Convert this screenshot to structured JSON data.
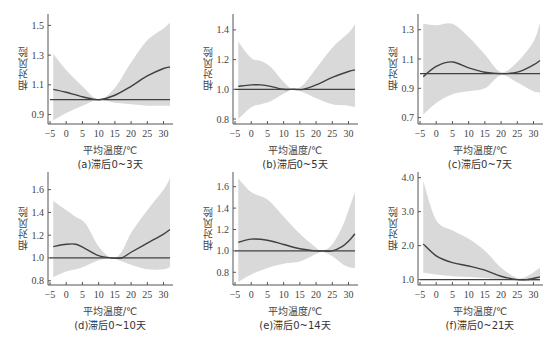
{
  "labels": {
    "ylabel": "相对风险",
    "xlabel": "平均温度/℃"
  },
  "colors": {
    "band": "#d9d9d9",
    "line": "#404040",
    "ref": "#404040",
    "axis": "#555555"
  },
  "chart_data": [
    {
      "type": "line",
      "caption": "(a)滞后0~3天",
      "xlim": [
        -5,
        32
      ],
      "ylim": [
        0.85,
        1.55
      ],
      "xticks": [
        -5,
        0,
        5,
        10,
        15,
        20,
        25,
        30
      ],
      "yticks": [
        0.9,
        1.1,
        1.3,
        1.5
      ],
      "x": [
        -4,
        0,
        5,
        10,
        15,
        20,
        25,
        30,
        32
      ],
      "rr": [
        1.07,
        1.05,
        1.02,
        1.0,
        1.03,
        1.09,
        1.16,
        1.21,
        1.22
      ],
      "lower": [
        0.86,
        0.91,
        0.96,
        1.0,
        0.98,
        0.97,
        0.96,
        0.96,
        0.96
      ],
      "upper": [
        1.31,
        1.2,
        1.09,
        1.0,
        1.08,
        1.25,
        1.4,
        1.48,
        1.52
      ]
    },
    {
      "type": "line",
      "caption": "(b)滞后0~5天",
      "xlim": [
        -5,
        32
      ],
      "ylim": [
        0.78,
        1.48
      ],
      "xticks": [
        -5,
        0,
        5,
        10,
        15,
        20,
        25,
        30
      ],
      "yticks": [
        0.8,
        1.0,
        1.2,
        1.4
      ],
      "x": [
        -4,
        0,
        3,
        6,
        10,
        13,
        16,
        20,
        25,
        30,
        32
      ],
      "rr": [
        1.02,
        1.03,
        1.03,
        1.02,
        1.0,
        1.0,
        1.0,
        1.03,
        1.08,
        1.12,
        1.13
      ],
      "lower": [
        0.8,
        0.88,
        0.9,
        0.92,
        0.97,
        1.0,
        0.98,
        0.94,
        0.9,
        0.89,
        0.88
      ],
      "upper": [
        1.32,
        1.21,
        1.19,
        1.15,
        1.05,
        1.0,
        1.03,
        1.14,
        1.28,
        1.38,
        1.44
      ]
    },
    {
      "type": "line",
      "caption": "(c)滞后0~7天",
      "xlim": [
        -5,
        32
      ],
      "ylim": [
        0.67,
        1.38
      ],
      "xticks": [
        -5,
        0,
        5,
        10,
        15,
        20,
        25,
        30
      ],
      "yticks": [
        0.7,
        0.9,
        1.1,
        1.3
      ],
      "x": [
        -4,
        0,
        5,
        10,
        15,
        20,
        25,
        30,
        32
      ],
      "rr": [
        0.98,
        1.05,
        1.08,
        1.04,
        1.01,
        1.0,
        1.01,
        1.06,
        1.09
      ],
      "lower": [
        0.72,
        0.8,
        0.86,
        0.88,
        0.9,
        0.99,
        0.94,
        0.88,
        0.87
      ],
      "upper": [
        1.34,
        1.33,
        1.34,
        1.25,
        1.13,
        1.01,
        1.08,
        1.22,
        1.35
      ]
    },
    {
      "type": "line",
      "caption": "(d)滞后0~10天",
      "xlim": [
        -5,
        32
      ],
      "ylim": [
        0.78,
        1.72
      ],
      "xticks": [
        -5,
        0,
        5,
        10,
        15,
        20,
        25,
        30
      ],
      "yticks": [
        0.8,
        1.0,
        1.2,
        1.4,
        1.6
      ],
      "x": [
        -4,
        0,
        3,
        6,
        10,
        14,
        17,
        20,
        25,
        30,
        32
      ],
      "rr": [
        1.1,
        1.12,
        1.12,
        1.08,
        1.02,
        1.0,
        1.0,
        1.05,
        1.13,
        1.21,
        1.25
      ],
      "lower": [
        0.83,
        0.88,
        0.9,
        0.93,
        0.98,
        1.0,
        0.97,
        0.94,
        0.9,
        0.9,
        0.92
      ],
      "upper": [
        1.5,
        1.42,
        1.36,
        1.3,
        1.1,
        1.0,
        1.05,
        1.22,
        1.42,
        1.6,
        1.7
      ]
    },
    {
      "type": "line",
      "caption": "(e)滞后0~14天",
      "xlim": [
        -5,
        32
      ],
      "ylim": [
        0.7,
        1.7
      ],
      "xticks": [
        -5,
        0,
        5,
        10,
        15,
        20,
        25,
        30
      ],
      "yticks": [
        0.8,
        1.0,
        1.2,
        1.4,
        1.6
      ],
      "x": [
        -4,
        0,
        5,
        10,
        15,
        20,
        22,
        25,
        28,
        30,
        32
      ],
      "rr": [
        1.08,
        1.11,
        1.1,
        1.06,
        1.02,
        1.0,
        1.0,
        1.0,
        1.04,
        1.09,
        1.16
      ],
      "lower": [
        0.71,
        0.78,
        0.84,
        0.88,
        0.9,
        0.97,
        0.99,
        0.95,
        0.88,
        0.85,
        0.84
      ],
      "upper": [
        1.68,
        1.55,
        1.48,
        1.32,
        1.16,
        1.03,
        1.0,
        1.06,
        1.22,
        1.38,
        1.55
      ]
    },
    {
      "type": "line",
      "caption": "(f)滞后0~21天",
      "xlim": [
        -5,
        32
      ],
      "ylim": [
        0.9,
        4.05
      ],
      "xticks": [
        -5,
        0,
        5,
        10,
        15,
        20,
        25,
        30
      ],
      "yticks": [
        1.0,
        2.0,
        3.0,
        4.0
      ],
      "x": [
        -4,
        0,
        5,
        10,
        15,
        20,
        25,
        28,
        32
      ],
      "rr": [
        2.05,
        1.7,
        1.5,
        1.4,
        1.28,
        1.1,
        1.0,
        1.0,
        1.08
      ],
      "lower": [
        1.2,
        1.15,
        1.1,
        1.08,
        1.05,
        1.0,
        0.97,
        0.95,
        0.95
      ],
      "upper": [
        3.9,
        2.75,
        2.45,
        2.2,
        1.85,
        1.35,
        1.05,
        1.1,
        1.35
      ]
    }
  ]
}
